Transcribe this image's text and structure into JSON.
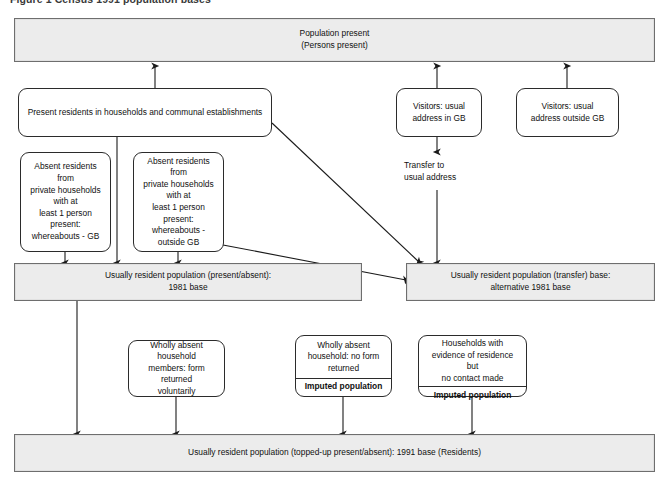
{
  "figure": {
    "caption": "Figure 1  Census 1991 population bases",
    "width": 669,
    "height": 483,
    "bar_fill": "#ececec",
    "bar_border": "#6e6e6e",
    "box_border": "#2b2b2b",
    "box_fill": "#ffffff",
    "arrow_color": "#1a1a1a",
    "background": "#ffffff"
  },
  "nodes": {
    "population_present": {
      "label": "Population present\n(Persons present)",
      "shape": "shaded-bar"
    },
    "present_residents": {
      "label": "Present residents in households and communal establishments",
      "shape": "rounded-box"
    },
    "visitors_in_gb": {
      "label": "Visitors: usual\naddress in GB",
      "shape": "rounded-box"
    },
    "visitors_outside_gb": {
      "label": "Visitors: usual\naddress outside GB",
      "shape": "rounded-box"
    },
    "absent_gb": {
      "label": "Absent residents from\nprivate households with at\nleast 1 person present:\nwhereabouts - GB",
      "shape": "rounded-box"
    },
    "absent_outside_gb": {
      "label": "Absent residents from\nprivate households with at\nleast 1 person present:\nwhereabouts - outside GB",
      "shape": "rounded-box"
    },
    "transfer_label": {
      "label": "Transfer to\nusual address",
      "shape": "plain-text"
    },
    "urp_present_absent": {
      "label": "Usually resident population (present/absent):\n1981 base",
      "shape": "shaded-bar"
    },
    "urp_transfer": {
      "label": "Usually resident population (transfer) base:\nalternative 1981 base",
      "shape": "shaded-bar"
    },
    "wholly_absent_voluntary": {
      "label": "Wholly absent household\nmembers: form returned\nvoluntarily",
      "shape": "rounded-box"
    },
    "wholly_absent_no_form": {
      "label": "Wholly absent\nhousehold: no form\nreturned",
      "footer": "Imputed population",
      "shape": "rounded-box-split"
    },
    "no_contact_made": {
      "label": "Households with\nevidence of residence but\nno contact made",
      "footer": "Imputed population",
      "shape": "rounded-box-split"
    },
    "urp_topped_up": {
      "label": "Usually resident population (topped-up present/absent): 1991 base (Residents)",
      "shape": "shaded-bar"
    }
  },
  "edges": [
    {
      "from": "present_residents",
      "to": "population_present",
      "kind": "arrow-up"
    },
    {
      "from": "visitors_in_gb",
      "to": "population_present",
      "kind": "arrow-up"
    },
    {
      "from": "visitors_outside_gb",
      "to": "population_present",
      "kind": "arrow-up"
    },
    {
      "from": "present_residents",
      "to": "urp_present_absent",
      "kind": "arrow-down"
    },
    {
      "from": "present_residents",
      "to": "urp_transfer",
      "kind": "arrow-diagonal"
    },
    {
      "from": "absent_gb",
      "to": "urp_present_absent",
      "kind": "arrow-down"
    },
    {
      "from": "absent_outside_gb",
      "to": "urp_present_absent",
      "kind": "arrow-down"
    },
    {
      "from": "absent_outside_gb",
      "to": "urp_transfer",
      "kind": "arrow-diagonal"
    },
    {
      "from": "visitors_in_gb",
      "to": "transfer_label",
      "kind": "arrow-down"
    },
    {
      "from": "transfer_label",
      "to": "urp_transfer",
      "kind": "arrow-down"
    },
    {
      "from": "urp_present_absent",
      "to": "urp_topped_up",
      "kind": "arrow-down"
    },
    {
      "from": "wholly_absent_voluntary",
      "to": "urp_topped_up",
      "kind": "arrow-down"
    },
    {
      "from": "wholly_absent_no_form",
      "to": "urp_topped_up",
      "kind": "arrow-down"
    },
    {
      "from": "no_contact_made",
      "to": "urp_topped_up",
      "kind": "arrow-down"
    }
  ]
}
